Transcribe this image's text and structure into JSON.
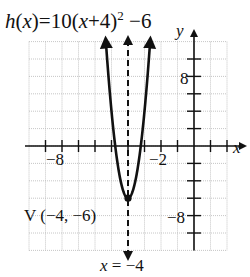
{
  "title": {
    "fn": "h",
    "var": "x",
    "text_before": "=10(",
    "text_inner": "+4)",
    "exponent": "2",
    "text_after": " −6"
  },
  "axes": {
    "x_label": "x",
    "y_label": "y",
    "x_tick_labels": [
      {
        "value": -8,
        "text": "−8"
      },
      {
        "value": -2,
        "text": "−2"
      }
    ],
    "y_tick_labels": [
      {
        "value": 8,
        "text": "8"
      },
      {
        "value": -8,
        "text": "−8"
      }
    ]
  },
  "annotations": {
    "vertex_label": "V (−4, −6)",
    "axis_of_symmetry_label_var": "x",
    "axis_of_symmetry_label_rest": " = −4"
  },
  "colors": {
    "curve": "#111111",
    "grid": "#b8b8b8",
    "background": "#ffffff"
  },
  "chart_data": {
    "type": "line",
    "xlabel": "x",
    "ylabel": "y",
    "xlim": [
      -10,
      2
    ],
    "ylim": [
      -12,
      12
    ],
    "grid": true,
    "x_grid_step": 1,
    "y_grid_step": 2,
    "x_tick_step": 1,
    "y_tick_step": 2,
    "x_tick_labels": {
      "-8": "−8",
      "-2": "−2"
    },
    "y_tick_labels": {
      "8": "8",
      "-8": "−8"
    },
    "legend": null,
    "series": [
      {
        "name": "h(x) = 10(x+4)^2 − 6",
        "style": "solid",
        "x": [
          -5.34,
          -5.2,
          -5.0,
          -4.8,
          -4.6,
          -4.4,
          -4.2,
          -4.0,
          -3.8,
          -3.6,
          -3.4,
          -3.2,
          -3.0,
          -2.8,
          -2.66
        ],
        "y": [
          11.96,
          8.4,
          4.0,
          0.4,
          -2.4,
          -4.4,
          -5.6,
          -6.0,
          -5.6,
          -4.4,
          -2.4,
          0.4,
          4.0,
          8.4,
          11.96
        ]
      },
      {
        "name": "axis of symmetry x = −4",
        "style": "dashed",
        "x": [
          -4,
          -4
        ],
        "y": [
          12,
          -13
        ]
      }
    ],
    "annotations": [
      {
        "text": "V (−4, −6)",
        "x": -4,
        "y": -6,
        "type": "vertex point"
      },
      {
        "text": "x = −4",
        "type": "axis of symmetry label"
      }
    ]
  }
}
